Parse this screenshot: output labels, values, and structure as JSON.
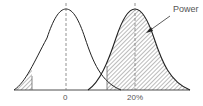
{
  "diagram": {
    "curves": [
      {
        "name": "null-distribution",
        "center_label": "0"
      },
      {
        "name": "alternative-distribution",
        "center_label": "20%"
      }
    ],
    "annotation": "Power",
    "x_labels": [
      "0",
      "20%"
    ],
    "colors": {
      "stroke": "#222222",
      "hatch": "#444444",
      "dash": "#777777",
      "text": "#555555"
    }
  }
}
